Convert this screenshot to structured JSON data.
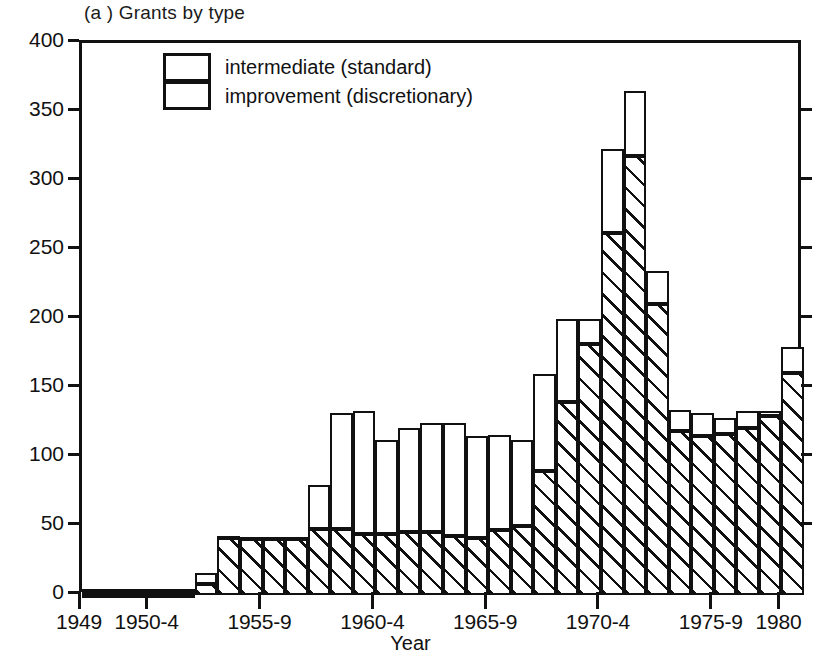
{
  "panel": {
    "title": "(a ) Grants by type"
  },
  "legend": {
    "position": "top-left-inside",
    "items": [
      {
        "label": "intermediate (standard)",
        "pattern": "solid-white",
        "name": "legend-item-intermediate"
      },
      {
        "label": "improvement (discretionary)",
        "pattern": "diagonal-hatch",
        "name": "legend-item-improvement"
      }
    ]
  },
  "axes": {
    "ylabel": "Thousands",
    "xlabel": "Year",
    "ylim": [
      0,
      400
    ],
    "yticks": [
      0,
      50,
      100,
      150,
      200,
      250,
      300,
      350,
      400
    ],
    "ytick_labels": [
      "0",
      "50",
      "100",
      "150",
      "200",
      "250",
      "300",
      "350",
      "400"
    ],
    "right_axis_ticks": [
      50,
      100,
      150,
      200,
      250,
      300,
      350
    ],
    "xlim": [
      1949,
      1981
    ],
    "xtick_years": [
      1949,
      1952,
      1957,
      1962,
      1967,
      1972,
      1977,
      1980
    ],
    "xtick_labels": [
      "1949",
      "1950-4",
      "1955-9",
      "1960-4",
      "1965-9",
      "1970-4",
      "1975-9",
      "1980"
    ]
  },
  "chart_data": {
    "type": "bar",
    "title": "(a ) Grants by type",
    "subtitle": "",
    "xlabel": "Year",
    "ylabel": "Thousands",
    "ylim": [
      0,
      400
    ],
    "grid": false,
    "stacked": true,
    "legend_position": "upper left (inside axes)",
    "units": "thousands of grants",
    "categories": [
      "1949",
      "1950",
      "1951",
      "1952",
      "1953",
      "1954",
      "1955",
      "1956",
      "1957",
      "1958",
      "1959",
      "1960",
      "1961",
      "1962",
      "1963",
      "1964",
      "1965",
      "1966",
      "1967",
      "1968",
      "1969",
      "1970",
      "1971",
      "1972",
      "1973",
      "1974",
      "1975",
      "1976",
      "1977",
      "1978",
      "1979",
      "1980"
    ],
    "series": [
      {
        "name": "improvement (discretionary)",
        "pattern": "diagonal-hatch",
        "values": [
          1,
          1,
          1,
          1,
          1,
          8,
          42,
          41,
          41,
          41,
          48,
          48,
          44,
          44,
          46,
          46,
          43,
          41,
          47,
          50,
          90,
          140,
          182,
          262,
          318,
          211,
          119,
          115,
          117,
          121,
          130,
          161
        ]
      },
      {
        "name": "intermediate (standard)",
        "pattern": "solid-white",
        "values": [
          1,
          1,
          1,
          1,
          1,
          8,
          1,
          1,
          1,
          1,
          32,
          84,
          89,
          68,
          75,
          79,
          82,
          74,
          69,
          62,
          70,
          60,
          18,
          61,
          47,
          24,
          15,
          17,
          11,
          12,
          3,
          19
        ]
      }
    ],
    "totals": [
      2,
      2,
      2,
      2,
      2,
      16,
      43,
      42,
      42,
      42,
      80,
      132,
      133,
      112,
      121,
      125,
      125,
      115,
      116,
      112,
      160,
      200,
      200,
      323,
      365,
      235,
      134,
      132,
      128,
      133,
      133,
      180
    ],
    "annotations": [
      "Peak total of approximately 365 thousand grants in 1973",
      "Improvement (discretionary) grants dominate from 1970 onward"
    ]
  }
}
